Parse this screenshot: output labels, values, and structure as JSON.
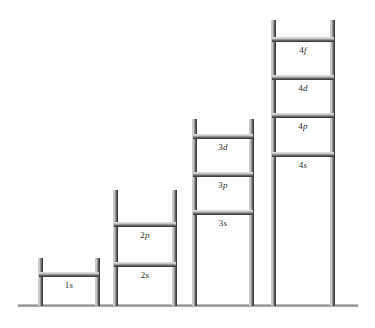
{
  "figure": {
    "type": "orbital-energy-ladder-diagram",
    "background_color": "#ffffff",
    "rail_color_light": "#e4e4e4",
    "rail_color_dark": "#3d3d3d",
    "rung_color_light": "#eaeaea",
    "rung_color_dark": "#3c3c3c",
    "ground_color": "#8e8e8e"
  },
  "ground": {
    "label": "baseline",
    "left": 18,
    "top": 304,
    "width": 340
  },
  "ladders": [
    {
      "name": "ladder-n1",
      "shell": "1",
      "left": 38,
      "top": 258,
      "width": 62,
      "height": 48,
      "rungs": [
        {
          "label_n": "1",
          "label_orbital": "s",
          "label_full": "1s",
          "offset_top": 14
        }
      ]
    },
    {
      "name": "ladder-n2",
      "shell": "2",
      "left": 113,
      "top": 190,
      "width": 64,
      "height": 116,
      "rungs": [
        {
          "label_n": "2",
          "label_orbital": "p",
          "label_full": "2p",
          "offset_top": 32
        },
        {
          "label_n": "2",
          "label_orbital": "s",
          "label_full": "2s",
          "offset_top": 72
        }
      ]
    },
    {
      "name": "ladder-n3",
      "shell": "3",
      "left": 192,
      "top": 119,
      "width": 62,
      "height": 187,
      "rungs": [
        {
          "label_n": "3",
          "label_orbital": "d",
          "label_full": "3d",
          "offset_top": 15
        },
        {
          "label_n": "3",
          "label_orbital": "p",
          "label_full": "3p",
          "offset_top": 53
        },
        {
          "label_n": "3",
          "label_orbital": "s",
          "label_full": "3s",
          "offset_top": 91
        }
      ]
    },
    {
      "name": "ladder-n4",
      "shell": "4",
      "left": 271,
      "top": 20,
      "width": 64,
      "height": 286,
      "rungs": [
        {
          "label_n": "4",
          "label_orbital": "f",
          "label_full": "4f",
          "offset_top": 17
        },
        {
          "label_n": "4",
          "label_orbital": "d",
          "label_full": "4d",
          "offset_top": 55
        },
        {
          "label_n": "4",
          "label_orbital": "p",
          "label_full": "4p",
          "offset_top": 93
        },
        {
          "label_n": "4",
          "label_orbital": "s",
          "label_full": "4s",
          "offset_top": 132
        }
      ]
    }
  ],
  "chart_data": {
    "type": "diagram",
    "title": "",
    "categories": [
      "n=1",
      "n=2",
      "n=3",
      "n=4"
    ],
    "series": [
      {
        "name": "orbitals",
        "values": [
          [
            "1s"
          ],
          [
            "2s",
            "2p"
          ],
          [
            "3s",
            "3p",
            "3d"
          ],
          [
            "4s",
            "4p",
            "4d",
            "4f"
          ]
        ]
      }
    ]
  }
}
